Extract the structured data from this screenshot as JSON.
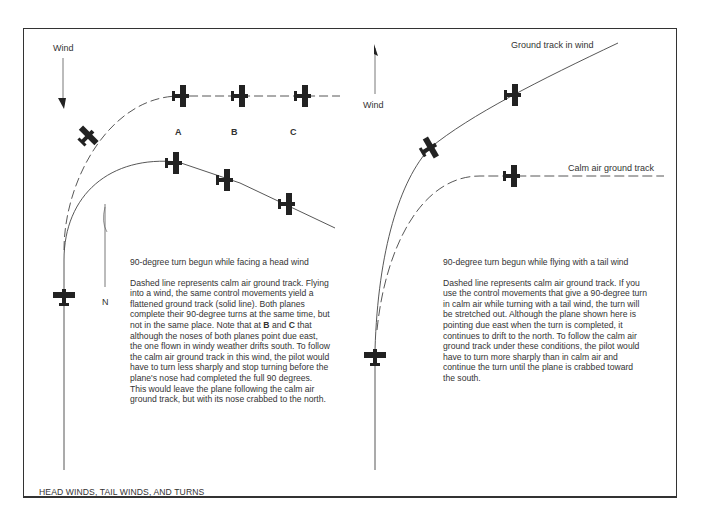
{
  "figure": {
    "title": "HEAD WINDS, TAIL WINDS, AND TURNS",
    "colors": {
      "line": "#444444",
      "plane": "#222222",
      "text": "#333333",
      "background": "#ffffff"
    }
  },
  "left_panel": {
    "wind_label": "Wind",
    "wind_direction": "south (arrow pointing down)",
    "north_label": "N",
    "position_labels": [
      "A",
      "B",
      "C"
    ],
    "caption_title": "90-degree turn begun while facing a head wind",
    "caption_body_parts": [
      "Dashed line represents calm air ground track. Flying into a wind, the same control movements yield a flattened ground track (solid line). Both planes complete their 90-degree turns at the same time, but not in the same place. Note that at ",
      "B",
      " and ",
      "C",
      " that although the noses of both planes point due east, the one flown in windy weather drifts south. To follow the calm air ground track in this wind, the pilot would have to turn less sharply and stop turning before the plane's nose had completed the full 90 degrees. This would leave the plane following the calm air ground track, but with its nose crabbed to the north."
    ]
  },
  "right_panel": {
    "wind_label": "Wind",
    "wind_direction": "north (arrow pointing up)",
    "track_labels": {
      "wind": "Ground track in wind",
      "calm": "Calm air ground track"
    },
    "caption_title": "90-degree turn begun while flying with a tail wind",
    "caption_body": "Dashed line represents calm air ground track. If you use the control movements that give a 90-degree turn in calm air while turning with a tail wind, the turn will be stretched out. Although the plane shown here is pointing due east when the turn is completed, it continues to drift to the north. To follow the calm air ground track under these conditions, the pilot would have to turn more sharply than in calm air and continue the turn until the plane is crabbed toward the south."
  }
}
